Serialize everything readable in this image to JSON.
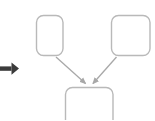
{
  "canvas": {
    "width": 155,
    "height": 120,
    "background": "#ffffff"
  },
  "diagram": {
    "type": "flowchart",
    "title": "",
    "node_style": {
      "fill": "#ffffff",
      "stroke": "#b9b9b9",
      "stroke_width": 1.4,
      "corner_radius": 7
    },
    "edge_style": {
      "stroke": "#a8a8a8",
      "stroke_width": 1.3,
      "arrowhead": "filled-triangle"
    },
    "nodes": [
      {
        "id": "node-top-left",
        "label": "",
        "x": 36,
        "y": 15,
        "width": 27,
        "height": 41,
        "cropped": false
      },
      {
        "id": "node-top-right",
        "label": "",
        "x": 111,
        "y": 15,
        "width": 39,
        "height": 41,
        "cropped": false
      },
      {
        "id": "node-bottom-center",
        "label": "",
        "x": 65,
        "y": 87,
        "width": 48,
        "height": 40,
        "cropped": true
      }
    ],
    "edges": [
      {
        "id": "edge-left-to-bottom",
        "from": "node-top-left",
        "to": "node-bottom-center",
        "label": "",
        "start_x": 56,
        "start_y": 57,
        "end_x": 86,
        "end_y": 85,
        "direction": "down-right"
      },
      {
        "id": "edge-right-to-bottom",
        "from": "node-top-right",
        "to": "node-bottom-center",
        "label": "",
        "start_x": 116,
        "start_y": 57,
        "end_x": 93,
        "end_y": 85,
        "direction": "down-left"
      }
    ]
  },
  "marker": {
    "arrow_glyph": {
      "name": "right-arrow-icon",
      "color": "#3b3b3b",
      "x": 0,
      "y": 61,
      "width": 19,
      "height": 15,
      "direction": "right"
    }
  }
}
